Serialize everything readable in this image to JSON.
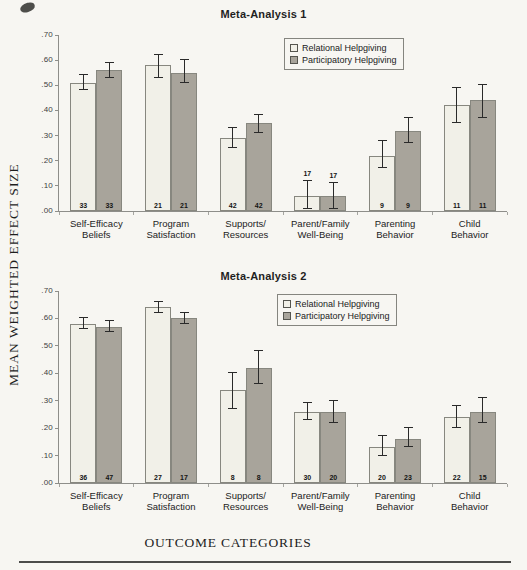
{
  "page": {
    "ylabel": "MEAN WEIGHTED EFFECT SIZE",
    "xlabel": "OUTCOME CATEGORIES"
  },
  "legend": {
    "items": [
      {
        "label": "Relational Helpgiving",
        "color": "#f1f0e8"
      },
      {
        "label": "Participatory Helpgiving",
        "color": "#a8a49b"
      }
    ]
  },
  "colors": {
    "relational_fill": "#f1f0e8",
    "participatory_fill": "#a8a49b",
    "bar_border": "#87877f",
    "axis": "#8e8e8a",
    "background": "#f7f6f2",
    "text": "#1f1f1f"
  },
  "chart_data": [
    {
      "type": "bar",
      "title": "Meta-Analysis 1",
      "ylim": [
        0,
        0.7
      ],
      "grid": false,
      "legend_position": "top-right",
      "yticks": [
        {
          "label": ".70",
          "value": 0.7
        },
        {
          "label": ".60",
          "value": 0.6
        },
        {
          "label": ".50",
          "value": 0.5
        },
        {
          "label": ".40",
          "value": 0.4
        },
        {
          "label": ".30",
          "value": 0.3
        },
        {
          "label": ".20",
          "value": 0.2
        },
        {
          "label": ".10",
          "value": 0.1
        },
        {
          "label": ".00",
          "value": 0.0
        }
      ],
      "categories": [
        [
          "Self-Efficacy",
          "Beliefs"
        ],
        [
          "Program",
          "Satisfaction"
        ],
        [
          "Supports/",
          "Resources"
        ],
        [
          "Parent/Family",
          "Well-Being"
        ],
        [
          "Parenting",
          "Behavior"
        ],
        [
          "Child",
          "Behavior"
        ]
      ],
      "series": [
        {
          "name": "Relational Helpgiving",
          "values": [
            0.51,
            0.58,
            0.29,
            0.06,
            0.22,
            0.42
          ],
          "errors_low": [
            0.48,
            0.53,
            0.25,
            0.01,
            0.17,
            0.35
          ],
          "errors_high": [
            0.54,
            0.62,
            0.33,
            0.12,
            0.28,
            0.49
          ],
          "n": [
            33,
            21,
            42,
            17,
            9,
            11
          ]
        },
        {
          "name": "Participatory Helpgiving",
          "values": [
            0.56,
            0.55,
            0.35,
            0.06,
            0.32,
            0.44
          ],
          "errors_low": [
            0.53,
            0.51,
            0.31,
            0.01,
            0.27,
            0.37
          ],
          "errors_high": [
            0.59,
            0.6,
            0.38,
            0.11,
            0.37,
            0.5
          ],
          "n": [
            33,
            21,
            42,
            17,
            9,
            11
          ]
        }
      ],
      "n_above_bar_categories": [
        3
      ]
    },
    {
      "type": "bar",
      "title": "Meta-Analysis 2",
      "ylim": [
        0,
        0.7
      ],
      "grid": false,
      "legend_position": "top-right",
      "yticks": [
        {
          "label": ".70",
          "value": 0.7
        },
        {
          "label": ".60",
          "value": 0.6
        },
        {
          "label": ".50",
          "value": 0.5
        },
        {
          "label": ".40",
          "value": 0.4
        },
        {
          "label": ".30",
          "value": 0.3
        },
        {
          "label": ".20",
          "value": 0.2
        },
        {
          "label": ".10",
          "value": 0.1
        },
        {
          "label": ".00",
          "value": 0.0
        }
      ],
      "categories": [
        [
          "Self-Efficacy",
          "Beliefs"
        ],
        [
          "Program",
          "Satisfaction"
        ],
        [
          "Supports/",
          "Resources"
        ],
        [
          "Parent/Family",
          "Well-Being"
        ],
        [
          "Parenting",
          "Behavior"
        ],
        [
          "Child",
          "Behavior"
        ]
      ],
      "series": [
        {
          "name": "Relational Helpgiving",
          "values": [
            0.58,
            0.64,
            0.34,
            0.26,
            0.13,
            0.24
          ],
          "errors_low": [
            0.56,
            0.62,
            0.27,
            0.23,
            0.1,
            0.2
          ],
          "errors_high": [
            0.6,
            0.66,
            0.4,
            0.29,
            0.17,
            0.28
          ],
          "n": [
            36,
            27,
            8,
            30,
            20,
            22
          ]
        },
        {
          "name": "Participatory Helpgiving",
          "values": [
            0.57,
            0.6,
            0.42,
            0.26,
            0.16,
            0.26
          ],
          "errors_low": [
            0.55,
            0.58,
            0.36,
            0.22,
            0.13,
            0.22
          ],
          "errors_high": [
            0.59,
            0.62,
            0.48,
            0.3,
            0.2,
            0.31
          ],
          "n": [
            47,
            17,
            8,
            20,
            23,
            15
          ]
        }
      ],
      "n_above_bar_categories": []
    }
  ]
}
